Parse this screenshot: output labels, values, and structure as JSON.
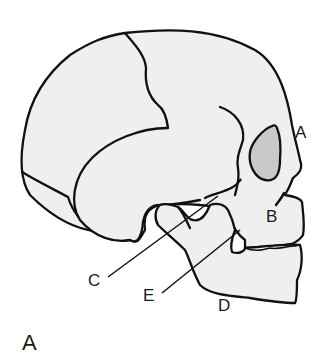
{
  "figure": {
    "panel_label": "A",
    "labels": [
      {
        "id": "A",
        "text": "A"
      },
      {
        "id": "B",
        "text": "B"
      },
      {
        "id": "C",
        "text": "C"
      },
      {
        "id": "D",
        "text": "D"
      },
      {
        "id": "E",
        "text": "E"
      }
    ],
    "colors": {
      "bone_fill": "#efefef",
      "orbit_fill": "#c9c9c9",
      "outline": "#111111",
      "background": "#ffffff"
    }
  }
}
